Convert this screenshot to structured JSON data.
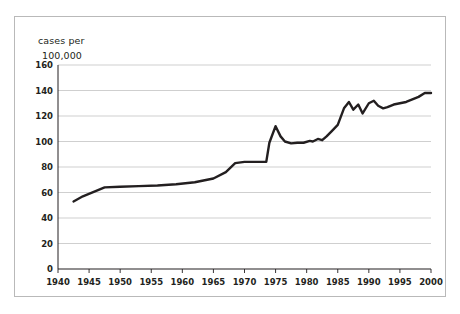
{
  "chart_data": {
    "type": "line",
    "title": "",
    "ylabel": "cases per 100,000",
    "ylabel_lines": [
      "cases per",
      "100,000"
    ],
    "xlabel": "",
    "xlim": [
      1940,
      2000
    ],
    "ylim": [
      0,
      160
    ],
    "grid": true,
    "legend": "none",
    "yticks": [
      0,
      20,
      40,
      60,
      80,
      100,
      120,
      140,
      160
    ],
    "ytick_labels": [
      "0",
      "20",
      "40",
      "60",
      "80",
      "100",
      "120",
      "140",
      "160"
    ],
    "xticks": [
      1940,
      1945,
      1950,
      1955,
      1960,
      1965,
      1970,
      1975,
      1980,
      1985,
      1990,
      1995,
      2000
    ],
    "xtick_labels": [
      "1940",
      "1945",
      "1950",
      "1955",
      "1960",
      "1965",
      "1970",
      "1975",
      "1980",
      "1985",
      "1990",
      "1995",
      "2000"
    ],
    "series": [
      {
        "name": "cases per 100,000",
        "color": "#231f20",
        "x": [
          1942.5,
          1944,
          1947.5,
          1950,
          1953,
          1956,
          1959,
          1962,
          1965,
          1967,
          1968.5,
          1970,
          1972,
          1973.5,
          1974,
          1975,
          1975.8,
          1976.5,
          1977.5,
          1978.5,
          1979.5,
          1980.5,
          1981,
          1981.8,
          1982.5,
          1983.2,
          1984,
          1985,
          1986,
          1986.8,
          1987.5,
          1988.3,
          1989,
          1990,
          1990.8,
          1991.5,
          1992.3,
          1993,
          1994,
          1995,
          1996,
          1997,
          1998,
          1999,
          2000
        ],
        "y": [
          53,
          57,
          64,
          64.5,
          65,
          65.5,
          66.5,
          68,
          71,
          76,
          83,
          84,
          84,
          84,
          99,
          112,
          104,
          100,
          98.5,
          99,
          99,
          100.5,
          100,
          102,
          101,
          104,
          108,
          113,
          126,
          131,
          125,
          129,
          122,
          130,
          132,
          128,
          126,
          127,
          129,
          130,
          131,
          133,
          135,
          138,
          138
        ]
      }
    ]
  }
}
